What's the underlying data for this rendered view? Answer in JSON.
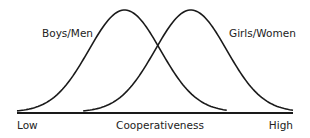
{
  "chart_data": {
    "type": "line",
    "title": "",
    "xlabel": "Cooperativeness",
    "ylabel": "",
    "x_tick_labels": {
      "low": "Low",
      "high": "High"
    },
    "xlim": [
      0,
      10
    ],
    "ylim": [
      0,
      1
    ],
    "grid": false,
    "series": [
      {
        "name": "Boys/Men",
        "distribution": "normal",
        "mean": 3.9,
        "sd": 1.3,
        "peak": 1.0,
        "range": [
          0,
          7.6
        ]
      },
      {
        "name": "Girls/Women",
        "distribution": "normal",
        "mean": 6.3,
        "sd": 1.3,
        "peak": 1.0,
        "range": [
          2.4,
          10
        ]
      }
    ],
    "annotations": [
      "Boys/Men",
      "Girls/Women"
    ],
    "colors": {
      "line": "#1a1a1a",
      "text": "#222222",
      "background": "#ffffff"
    }
  }
}
